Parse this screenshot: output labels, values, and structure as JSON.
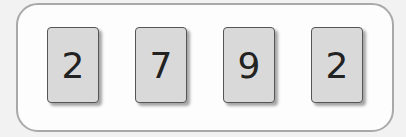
{
  "cards": [
    {
      "value": "2"
    },
    {
      "value": "7"
    },
    {
      "value": "9"
    },
    {
      "value": "2"
    }
  ]
}
